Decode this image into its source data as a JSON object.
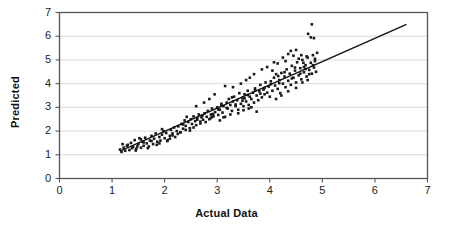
{
  "chart_data": {
    "type": "scatter",
    "title": "",
    "xlabel": "Actual Data",
    "ylabel": "Predicted",
    "xlim": [
      0,
      7
    ],
    "ylim": [
      0,
      7
    ],
    "xticks": [
      0,
      1,
      2,
      3,
      4,
      5,
      6,
      7
    ],
    "yticks": [
      0,
      1,
      2,
      3,
      4,
      5,
      6,
      7
    ],
    "grid": "horizontal",
    "legend": "none",
    "marker": {
      "shape": "square",
      "size": 2.6,
      "color": "#1a1a1a"
    },
    "trend_line": {
      "label": "",
      "color": "#111111",
      "width": 1.4,
      "x_start": 1.15,
      "y_start": 1.15,
      "x_end": 6.6,
      "y_end": 6.5
    },
    "series": [
      {
        "name": "Predicted vs Actual",
        "points": [
          [
            1.15,
            1.22
          ],
          [
            1.18,
            1.12
          ],
          [
            1.22,
            1.3
          ],
          [
            1.25,
            1.17
          ],
          [
            1.3,
            1.42
          ],
          [
            1.33,
            1.2
          ],
          [
            1.36,
            1.5
          ],
          [
            1.4,
            1.33
          ],
          [
            1.43,
            1.62
          ],
          [
            1.46,
            1.25
          ],
          [
            1.5,
            1.45
          ],
          [
            1.52,
            1.7
          ],
          [
            1.55,
            1.3
          ],
          [
            1.58,
            1.55
          ],
          [
            1.6,
            1.38
          ],
          [
            1.63,
            1.72
          ],
          [
            1.66,
            1.48
          ],
          [
            1.7,
            1.35
          ],
          [
            1.72,
            1.6
          ],
          [
            1.75,
            1.8
          ],
          [
            1.78,
            1.45
          ],
          [
            1.8,
            1.68
          ],
          [
            1.83,
            1.9
          ],
          [
            1.86,
            1.55
          ],
          [
            1.9,
            1.75
          ],
          [
            1.92,
            1.6
          ],
          [
            1.95,
            1.85
          ],
          [
            1.98,
            2.0
          ],
          [
            2.0,
            1.7
          ],
          [
            2.03,
            1.92
          ],
          [
            2.06,
            1.62
          ],
          [
            2.1,
            1.8
          ],
          [
            2.12,
            2.05
          ],
          [
            2.15,
            1.9
          ],
          [
            2.18,
            2.15
          ],
          [
            2.2,
            1.75
          ],
          [
            2.23,
            2.0
          ],
          [
            2.26,
            2.2
          ],
          [
            2.3,
            1.95
          ],
          [
            2.32,
            2.3
          ],
          [
            2.35,
            2.1
          ],
          [
            2.38,
            2.45
          ],
          [
            2.4,
            2.22
          ],
          [
            2.42,
            2.6
          ],
          [
            2.45,
            2.38
          ],
          [
            2.48,
            2.12
          ],
          [
            2.5,
            2.5
          ],
          [
            2.52,
            2.3
          ],
          [
            2.55,
            2.62
          ],
          [
            2.58,
            2.42
          ],
          [
            2.6,
            2.25
          ],
          [
            2.62,
            2.55
          ],
          [
            2.65,
            2.7
          ],
          [
            2.68,
            2.4
          ],
          [
            2.7,
            2.58
          ],
          [
            2.73,
            2.48
          ],
          [
            2.76,
            2.75
          ],
          [
            2.8,
            2.6
          ],
          [
            2.82,
            2.85
          ],
          [
            2.85,
            2.5
          ],
          [
            2.88,
            2.7
          ],
          [
            2.9,
            2.95
          ],
          [
            2.93,
            2.62
          ],
          [
            2.96,
            2.8
          ],
          [
            3.0,
            3.0
          ],
          [
            3.02,
            2.68
          ],
          [
            3.05,
            2.9
          ],
          [
            3.08,
            3.15
          ],
          [
            3.1,
            2.78
          ],
          [
            3.12,
            3.05
          ],
          [
            3.15,
            2.6
          ],
          [
            3.18,
            3.2
          ],
          [
            3.2,
            2.95
          ],
          [
            3.22,
            3.35
          ],
          [
            3.25,
            3.1
          ],
          [
            3.28,
            2.85
          ],
          [
            3.3,
            3.25
          ],
          [
            3.32,
            3.45
          ],
          [
            3.35,
            3.05
          ],
          [
            3.38,
            3.3
          ],
          [
            3.4,
            2.9
          ],
          [
            3.42,
            3.6
          ],
          [
            3.45,
            3.15
          ],
          [
            3.48,
            3.4
          ],
          [
            3.5,
            3.05
          ],
          [
            3.52,
            3.55
          ],
          [
            3.55,
            3.25
          ],
          [
            3.58,
            3.7
          ],
          [
            3.6,
            3.1
          ],
          [
            3.62,
            3.45
          ],
          [
            3.65,
            3.35
          ],
          [
            3.68,
            3.62
          ],
          [
            3.7,
            3.2
          ],
          [
            3.72,
            3.8
          ],
          [
            3.75,
            3.5
          ],
          [
            3.78,
            3.3
          ],
          [
            3.8,
            3.68
          ],
          [
            3.82,
            3.95
          ],
          [
            3.85,
            3.42
          ],
          [
            3.88,
            3.75
          ],
          [
            3.9,
            3.55
          ],
          [
            3.92,
            4.05
          ],
          [
            3.95,
            3.62
          ],
          [
            3.98,
            3.88
          ],
          [
            4.0,
            3.45
          ],
          [
            4.02,
            4.1
          ],
          [
            4.05,
            3.7
          ],
          [
            4.08,
            4.25
          ],
          [
            4.1,
            3.92
          ],
          [
            4.12,
            4.4
          ],
          [
            4.15,
            3.78
          ],
          [
            4.18,
            4.15
          ],
          [
            4.2,
            3.6
          ],
          [
            4.22,
            4.45
          ],
          [
            4.25,
            4.0
          ],
          [
            4.28,
            4.3
          ],
          [
            4.3,
            3.85
          ],
          [
            4.32,
            4.6
          ],
          [
            4.35,
            4.12
          ],
          [
            4.38,
            4.42
          ],
          [
            4.4,
            3.95
          ],
          [
            4.42,
            4.75
          ],
          [
            4.45,
            4.25
          ],
          [
            4.48,
            4.55
          ],
          [
            4.5,
            4.05
          ],
          [
            4.52,
            4.9
          ],
          [
            4.55,
            4.35
          ],
          [
            4.58,
            4.65
          ],
          [
            4.6,
            4.18
          ],
          [
            4.62,
            5.0
          ],
          [
            4.65,
            4.48
          ],
          [
            4.68,
            4.78
          ],
          [
            4.7,
            4.3
          ],
          [
            4.72,
            5.1
          ],
          [
            4.75,
            4.58
          ],
          [
            4.78,
            4.88
          ],
          [
            4.8,
            4.42
          ],
          [
            4.82,
            5.2
          ],
          [
            4.84,
            4.68
          ],
          [
            4.86,
            4.95
          ],
          [
            4.88,
            4.5
          ],
          [
            4.9,
            5.3
          ],
          [
            4.15,
            4.85
          ],
          [
            4.25,
            5.1
          ],
          [
            4.3,
            4.95
          ],
          [
            4.35,
            5.25
          ],
          [
            4.4,
            5.38
          ],
          [
            4.45,
            5.18
          ],
          [
            4.5,
            5.42
          ],
          [
            4.55,
            5.05
          ],
          [
            4.6,
            5.2
          ],
          [
            4.65,
            4.7
          ],
          [
            4.7,
            5.15
          ],
          [
            4.75,
            4.4
          ],
          [
            4.8,
            6.5
          ],
          [
            4.73,
            6.1
          ],
          [
            4.78,
            5.95
          ],
          [
            4.84,
            5.92
          ],
          [
            3.95,
            4.7
          ],
          [
            4.05,
            4.55
          ],
          [
            3.62,
            4.25
          ],
          [
            3.45,
            4.0
          ],
          [
            3.3,
            3.85
          ],
          [
            2.95,
            3.55
          ],
          [
            2.85,
            3.35
          ],
          [
            3.15,
            3.9
          ],
          [
            2.75,
            3.2
          ],
          [
            2.6,
            3.05
          ],
          [
            3.55,
            4.15
          ],
          [
            3.7,
            4.4
          ],
          [
            3.85,
            4.6
          ],
          [
            4.08,
            4.9
          ],
          [
            3.75,
            2.82
          ],
          [
            3.6,
            2.95
          ],
          [
            3.4,
            2.75
          ],
          [
            3.05,
            2.45
          ],
          [
            2.9,
            2.6
          ],
          [
            2.55,
            2.15
          ],
          [
            2.3,
            1.95
          ],
          [
            2.05,
            1.58
          ],
          [
            1.85,
            1.42
          ],
          [
            1.68,
            1.28
          ],
          [
            1.48,
            1.35
          ],
          [
            1.38,
            1.28
          ],
          [
            1.28,
            1.38
          ],
          [
            1.2,
            1.45
          ],
          [
            2.68,
            2.32
          ],
          [
            2.78,
            2.38
          ],
          [
            3.12,
            2.58
          ],
          [
            3.25,
            2.7
          ],
          [
            3.5,
            2.88
          ],
          [
            3.65,
            3.0
          ],
          [
            4.12,
            3.35
          ],
          [
            4.22,
            3.5
          ],
          [
            4.35,
            3.68
          ],
          [
            4.5,
            3.82
          ],
          [
            4.62,
            4.05
          ],
          [
            4.72,
            4.15
          ],
          [
            1.6,
            1.52
          ],
          [
            1.75,
            1.58
          ],
          [
            1.9,
            1.48
          ],
          [
            2.1,
            1.68
          ],
          [
            2.25,
            1.88
          ],
          [
            2.4,
            2.05
          ],
          [
            2.62,
            2.48
          ],
          [
            2.88,
            2.55
          ],
          [
            3.02,
            2.92
          ],
          [
            3.35,
            3.12
          ],
          [
            3.48,
            3.28
          ],
          [
            3.58,
            3.52
          ],
          [
            3.9,
            3.82
          ],
          [
            4.18,
            4.02
          ],
          [
            4.42,
            4.22
          ],
          [
            4.58,
            4.42
          ],
          [
            4.68,
            4.62
          ],
          [
            4.82,
            4.78
          ],
          [
            1.45,
            1.18
          ],
          [
            1.55,
            1.65
          ],
          [
            1.95,
            2.08
          ],
          [
            2.15,
            1.82
          ],
          [
            2.35,
            2.28
          ],
          [
            2.72,
            2.65
          ],
          [
            3.08,
            3.08
          ],
          [
            3.28,
            3.42
          ],
          [
            3.52,
            3.38
          ],
          [
            3.82,
            3.58
          ],
          [
            4.02,
            3.98
          ],
          [
            4.28,
            4.48
          ],
          [
            4.48,
            4.68
          ],
          [
            4.64,
            4.88
          ],
          [
            4.86,
            5.05
          ],
          [
            2.48,
            2.02
          ],
          [
            2.92,
            2.72
          ],
          [
            3.18,
            2.98
          ],
          [
            3.72,
            3.72
          ],
          [
            4.16,
            4.32
          ]
        ]
      }
    ]
  },
  "axes": {
    "x_ticks": [
      "0",
      "1",
      "2",
      "3",
      "4",
      "5",
      "6",
      "7"
    ],
    "y_ticks": [
      "0",
      "1",
      "2",
      "3",
      "4",
      "5",
      "6",
      "7"
    ],
    "x_title": "Actual Data",
    "y_title": "Predicted"
  },
  "colors": {
    "axis": "#555555",
    "grid": "#d9d9d9",
    "marker": "#1a1a1a",
    "trend": "#111111",
    "background": "#ffffff"
  }
}
